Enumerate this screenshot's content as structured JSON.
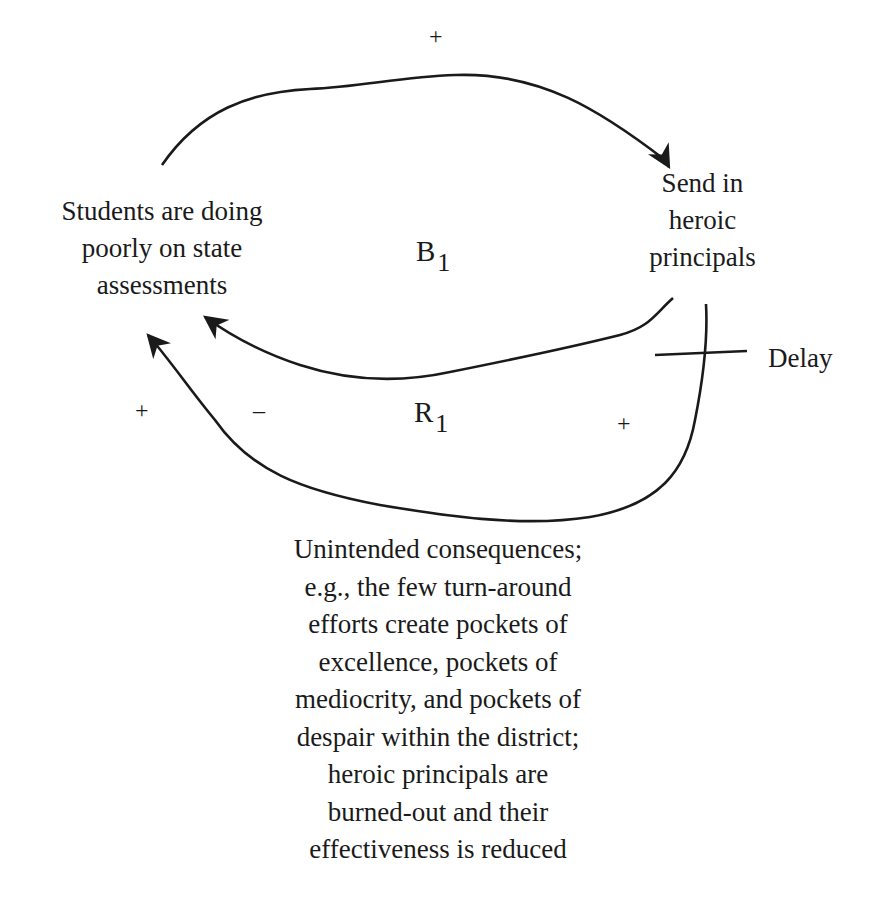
{
  "diagram": {
    "type": "causal-loop-diagram",
    "nodes": {
      "students": "Students are doing\npoorly on state\nassessments",
      "heroic": "Send in\nheroic\nprincipals",
      "unintended": "Unintended consequences;\ne.g., the few turn-around\nefforts create pockets of\nexcellence, pockets of\nmediocrity, and pockets of\ndespair within the district;\nheroic principals are\nburned-out and their\neffectiveness is reduced"
    },
    "loops": {
      "balancing": {
        "letter": "B",
        "index": "1"
      },
      "reinforcing": {
        "letter": "R",
        "index": "1"
      }
    },
    "links": [
      {
        "from": "students",
        "to": "heroic",
        "polarity": "+"
      },
      {
        "from": "heroic",
        "to": "students",
        "polarity": "–"
      },
      {
        "from": "heroic",
        "to": "unintended",
        "polarity": "+",
        "delay": true
      },
      {
        "from": "unintended",
        "to": "students",
        "polarity": "+"
      }
    ],
    "signs": {
      "top": "+",
      "left_plus": "+",
      "left_minus": "–",
      "right_plus": "+"
    },
    "delay_label": "Delay",
    "colors": {
      "line": "#1a1a1a",
      "background": "#ffffff"
    }
  }
}
